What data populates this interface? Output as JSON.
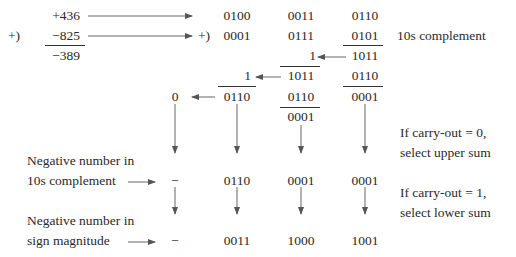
{
  "decimal": {
    "operand_a": "+436",
    "operator": "+)",
    "operand_b": "−825",
    "result": "−389"
  },
  "bcd": {
    "operator": "+)",
    "row_a": [
      "0100",
      "0011",
      "0110"
    ],
    "row_b": [
      "0001",
      "0111",
      "0101"
    ],
    "row_b_note": "10s complement",
    "stage1": {
      "carry": "1",
      "sum": "1011"
    },
    "stage2": {
      "carry": "1",
      "sum": [
        "1011",
        "0110"
      ]
    },
    "stage3": {
      "carry": "0",
      "sum": [
        "0110",
        "0110",
        "0001"
      ]
    },
    "corrected": "0001"
  },
  "labels": {
    "tens_comp_line1": "Negative number in",
    "tens_comp_line2": "10s complement",
    "sign_mag_line1": "Negative number in",
    "sign_mag_line2": "sign magnitude",
    "carry0_line1": "If carry-out = 0,",
    "carry0_line2": "select upper sum",
    "carry1_line1": "If carry-out = 1,",
    "carry1_line2": "select lower sum"
  },
  "result_tens_complement": {
    "sign": "−",
    "digits": [
      "0110",
      "0001",
      "0001"
    ]
  },
  "result_sign_magnitude": {
    "sign": "−",
    "digits": [
      "0011",
      "1000",
      "1001"
    ]
  }
}
